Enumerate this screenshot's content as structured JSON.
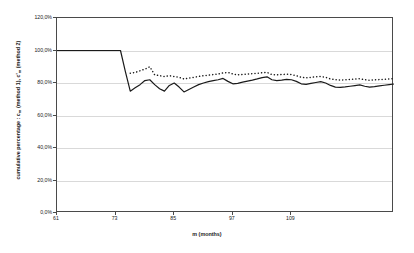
{
  "chart_data": {
    "type": "line",
    "title": "",
    "xlabel": "m (months)",
    "ylabel": "cumulative percentage : c_m (method 1), c'_m (method 2)",
    "ylabel_parts": {
      "prefix": "cumulative percentage : c",
      "sub1": "m",
      "mid": " (method 1), c'",
      "sub2": "m",
      "suffix": " (method 2)"
    },
    "xlim": [
      61,
      130
    ],
    "ylim": [
      0,
      120
    ],
    "ytick_labels": [
      "120,0%",
      "100,0%",
      "80,0%",
      "60,0%",
      "40,0%",
      "20,0%",
      "0,0%"
    ],
    "ytick_values": [
      120,
      100,
      80,
      60,
      40,
      20,
      0
    ],
    "xtick_labels": [
      "61",
      "73",
      "85",
      "97",
      "109"
    ],
    "xtick_values": [
      61,
      73,
      85,
      97,
      109
    ],
    "grid": true,
    "legend": "none",
    "x": [
      61,
      62,
      63,
      64,
      65,
      66,
      67,
      68,
      69,
      70,
      71,
      72,
      73,
      74,
      75,
      76,
      77,
      78,
      79,
      80,
      81,
      82,
      83,
      84,
      85,
      86,
      87,
      88,
      89,
      90,
      91,
      92,
      93,
      94,
      95,
      96,
      97,
      98,
      99,
      100,
      101,
      102,
      103,
      104,
      105,
      106,
      107,
      108,
      109,
      110,
      111,
      112,
      113,
      114,
      115,
      116,
      117,
      118,
      119,
      120,
      121,
      122,
      123,
      124,
      125,
      126,
      127,
      128,
      129,
      130
    ],
    "series": [
      {
        "name": "c_m (method 1)",
        "style": "solid",
        "color": "#1a1a1a",
        "values": [
          100.0,
          100.0,
          100.0,
          100.0,
          100.0,
          100.0,
          100.0,
          100.0,
          100.0,
          100.0,
          100.0,
          100.0,
          100.0,
          100.0,
          87.0,
          75.0,
          77.0,
          79.0,
          81.5,
          82.0,
          79.0,
          76.5,
          75.0,
          78.5,
          80.0,
          77.5,
          74.5,
          76.0,
          77.5,
          79.0,
          80.0,
          80.8,
          81.5,
          82.0,
          82.8,
          81.0,
          79.5,
          79.8,
          80.5,
          81.2,
          81.8,
          82.5,
          83.3,
          83.8,
          82.0,
          81.5,
          81.8,
          82.2,
          82.0,
          81.0,
          79.5,
          79.2,
          79.8,
          80.3,
          80.8,
          80.0,
          78.5,
          77.5,
          77.3,
          77.6,
          78.0,
          78.4,
          78.8,
          78.0,
          77.5,
          77.8,
          78.2,
          78.6,
          79.0,
          79.4
        ]
      },
      {
        "name": "c'_m (method 2)",
        "style": "dotted",
        "color": "#1a1a1a",
        "values": [
          null,
          null,
          null,
          null,
          null,
          null,
          null,
          null,
          null,
          null,
          null,
          null,
          null,
          null,
          null,
          86.0,
          86.5,
          87.5,
          88.5,
          90.0,
          85.0,
          84.5,
          84.0,
          84.5,
          84.0,
          83.5,
          82.5,
          83.0,
          83.5,
          84.0,
          84.5,
          84.8,
          85.2,
          85.5,
          86.2,
          86.5,
          85.5,
          85.0,
          85.2,
          85.5,
          85.8,
          86.0,
          86.3,
          86.5,
          85.2,
          85.0,
          85.2,
          85.4,
          85.2,
          84.5,
          83.5,
          83.2,
          83.5,
          83.8,
          84.0,
          83.5,
          82.5,
          82.0,
          81.8,
          82.0,
          82.2,
          82.4,
          82.6,
          82.0,
          81.7,
          81.9,
          82.1,
          82.3,
          82.5,
          82.7
        ]
      }
    ]
  }
}
